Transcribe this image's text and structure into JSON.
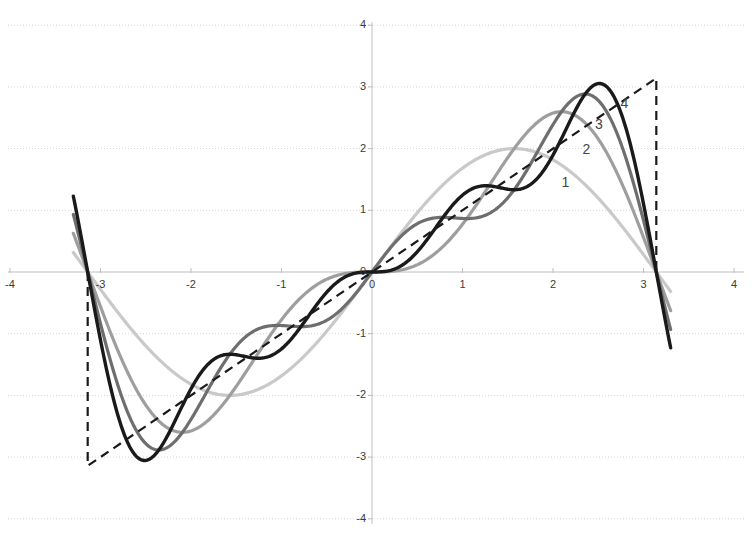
{
  "chart_data": {
    "type": "line",
    "title": "",
    "subtitle": "",
    "xlabel": "",
    "ylabel": "",
    "xlim": [
      -4,
      4
    ],
    "ylim": [
      -4,
      4
    ],
    "grid": true,
    "grid_axis": "y",
    "legend_position": "inline-annotations",
    "x_ticks": [
      "-4",
      "-3",
      "-2",
      "-1",
      "0",
      "1",
      "2",
      "3",
      "4"
    ],
    "x_tick_values": [
      -4,
      -3,
      -2,
      -1,
      0,
      1,
      2,
      3,
      4
    ],
    "y_ticks": [
      "4",
      "3",
      "2",
      "1",
      "0",
      "-1",
      "-2",
      "-3",
      "-4"
    ],
    "y_tick_values": [
      4,
      3,
      2,
      1,
      0,
      -1,
      -2,
      -3,
      -4
    ],
    "annotations": [
      {
        "text": "1",
        "x": 2.15,
        "y": 1.45
      },
      {
        "text": "2",
        "x": 2.38,
        "y": 1.97
      },
      {
        "text": "3",
        "x": 2.52,
        "y": 2.38
      },
      {
        "text": "4",
        "x": 2.8,
        "y": 2.72
      }
    ],
    "series": [
      {
        "name": "1",
        "terms": 1,
        "color": "#c9c9c9",
        "width": 3.2,
        "dash": "none",
        "description": "Fourier partial sum with 1 sine term: 2*sin(x)",
        "peak": {
          "x": 1.57,
          "y": 2.0
        },
        "trough": {
          "x": -1.57,
          "y": -2.0
        }
      },
      {
        "name": "2",
        "terms": 2,
        "color": "#9e9e9e",
        "width": 3.2,
        "dash": "none",
        "description": "Fourier partial sum with 2 sine terms: 2*sin(x) - sin(2x)",
        "peak": {
          "x": 2.03,
          "y": 2.43
        },
        "trough": {
          "x": -2.03,
          "y": -2.43
        }
      },
      {
        "name": "3",
        "terms": 3,
        "color": "#6e6e6e",
        "width": 3.2,
        "dash": "none",
        "description": "Fourier partial sum with 3 sine terms: 2*sin(x) - sin(2x) + (2/3)*sin(3x)",
        "peak": {
          "x": 2.33,
          "y": 2.72
        },
        "trough": {
          "x": -2.33,
          "y": -2.72
        }
      },
      {
        "name": "4",
        "terms": 4,
        "color": "#1a1a1a",
        "width": 3.4,
        "dash": "none",
        "description": "Fourier partial sum with 4 sine terms: 2*sin(x) - sin(2x) + (2/3)*sin(3x) - (1/2)*sin(4x)",
        "peak": {
          "x": 2.62,
          "y": 3.05
        },
        "trough": {
          "x": -2.62,
          "y": -3.05
        }
      },
      {
        "name": "target",
        "terms": 0,
        "color": "#1a1a1a",
        "width": 2.2,
        "dash": "9,6",
        "description": "Target sawtooth function f(x)=x on (-pi, pi), dashed, with vertical jumps at +/- pi",
        "x_start": -3.142,
        "x_end": 3.142,
        "y_start": -3.142,
        "y_end": 3.142
      }
    ],
    "axes": {
      "axis_color": "#bfbfbf",
      "grid_color": "#d6d6d6",
      "x_axis_y": 0,
      "y_axis_x": 0
    }
  },
  "geometry": {
    "origin_px": {
      "x": 372,
      "y": 272
    },
    "unit_px": {
      "x": 90.5,
      "y": 61.7
    },
    "plot_rect": {
      "left": 8,
      "top": 22,
      "right": 744,
      "bottom": 524
    }
  }
}
